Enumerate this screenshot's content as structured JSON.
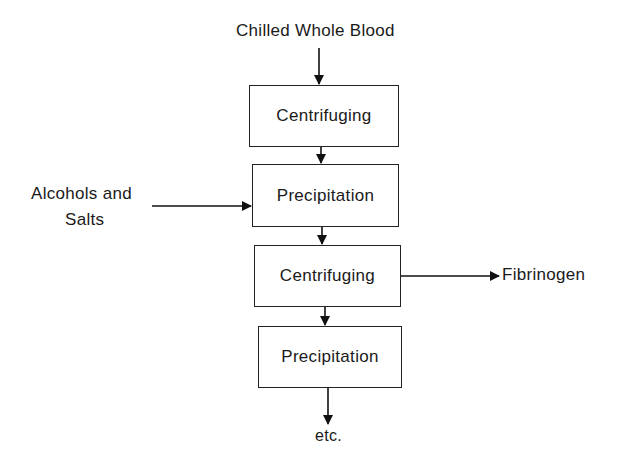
{
  "diagram": {
    "input_top": "Chilled Whole Blood",
    "side_input": {
      "line1": "Alcohols and",
      "line2": "Salts"
    },
    "steps": [
      {
        "label": "Centrifuging"
      },
      {
        "label": "Precipitation"
      },
      {
        "label": "Centrifuging"
      },
      {
        "label": "Precipitation"
      }
    ],
    "side_output": "Fibrinogen",
    "output_bottom": "etc."
  }
}
